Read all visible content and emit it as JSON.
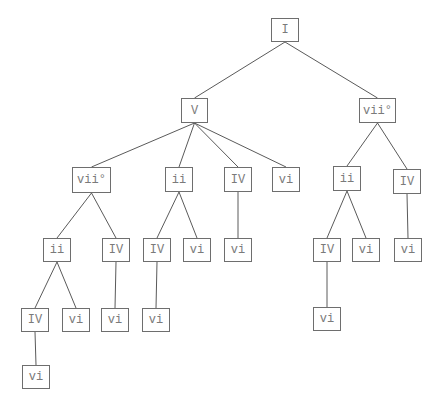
{
  "diagram": {
    "type": "tree",
    "colors": {
      "edge": "#5a5a5a",
      "border": "#6e6e6e",
      "text": "#7a7a7a"
    },
    "nodes": [
      {
        "id": "n0",
        "label": "I",
        "x": 271,
        "y": 18,
        "w": 28,
        "h": 24
      },
      {
        "id": "n1",
        "label": "V",
        "x": 181,
        "y": 98,
        "w": 27,
        "h": 25
      },
      {
        "id": "n2",
        "label": "vii°",
        "x": 359,
        "y": 98,
        "w": 37,
        "h": 25
      },
      {
        "id": "n3",
        "label": "vii°",
        "x": 72,
        "y": 167,
        "w": 39,
        "h": 26
      },
      {
        "id": "n4",
        "label": "ii",
        "x": 165,
        "y": 167,
        "w": 28,
        "h": 25
      },
      {
        "id": "n5",
        "label": "IV",
        "x": 224,
        "y": 167,
        "w": 28,
        "h": 25
      },
      {
        "id": "n6",
        "label": "vi",
        "x": 272,
        "y": 167,
        "w": 28,
        "h": 25
      },
      {
        "id": "n7",
        "label": "ii",
        "x": 333,
        "y": 166,
        "w": 28,
        "h": 25
      },
      {
        "id": "n8",
        "label": "IV",
        "x": 393,
        "y": 169,
        "w": 28,
        "h": 25
      },
      {
        "id": "n9",
        "label": "ii",
        "x": 43,
        "y": 238,
        "w": 28,
        "h": 24
      },
      {
        "id": "n10",
        "label": "IV",
        "x": 102,
        "y": 238,
        "w": 28,
        "h": 24
      },
      {
        "id": "n11",
        "label": "IV",
        "x": 143,
        "y": 238,
        "w": 28,
        "h": 24
      },
      {
        "id": "n12",
        "label": "vi",
        "x": 183,
        "y": 238,
        "w": 28,
        "h": 24
      },
      {
        "id": "n13",
        "label": "vi",
        "x": 224,
        "y": 238,
        "w": 28,
        "h": 24
      },
      {
        "id": "n14",
        "label": "IV",
        "x": 313,
        "y": 238,
        "w": 28,
        "h": 24
      },
      {
        "id": "n15",
        "label": "vi",
        "x": 352,
        "y": 238,
        "w": 28,
        "h": 24
      },
      {
        "id": "n16",
        "label": "vi",
        "x": 394,
        "y": 238,
        "w": 28,
        "h": 24
      },
      {
        "id": "n17",
        "label": "IV",
        "x": 21,
        "y": 308,
        "w": 28,
        "h": 24
      },
      {
        "id": "n18",
        "label": "vi",
        "x": 62,
        "y": 308,
        "w": 28,
        "h": 24
      },
      {
        "id": "n19",
        "label": "vi",
        "x": 101,
        "y": 308,
        "w": 28,
        "h": 24
      },
      {
        "id": "n20",
        "label": "vi",
        "x": 142,
        "y": 308,
        "w": 28,
        "h": 24
      },
      {
        "id": "n21",
        "label": "vi",
        "x": 313,
        "y": 307,
        "w": 28,
        "h": 24
      },
      {
        "id": "n22",
        "label": "vi",
        "x": 22,
        "y": 365,
        "w": 28,
        "h": 24
      }
    ],
    "edges": [
      [
        "n0",
        "n1"
      ],
      [
        "n0",
        "n2"
      ],
      [
        "n1",
        "n3"
      ],
      [
        "n1",
        "n4"
      ],
      [
        "n1",
        "n5"
      ],
      [
        "n1",
        "n6"
      ],
      [
        "n2",
        "n7"
      ],
      [
        "n2",
        "n8"
      ],
      [
        "n3",
        "n9"
      ],
      [
        "n3",
        "n10"
      ],
      [
        "n4",
        "n11"
      ],
      [
        "n4",
        "n12"
      ],
      [
        "n5",
        "n13"
      ],
      [
        "n7",
        "n14"
      ],
      [
        "n7",
        "n15"
      ],
      [
        "n8",
        "n16"
      ],
      [
        "n9",
        "n17"
      ],
      [
        "n9",
        "n18"
      ],
      [
        "n10",
        "n19"
      ],
      [
        "n11",
        "n20"
      ],
      [
        "n14",
        "n21"
      ],
      [
        "n17",
        "n22"
      ]
    ]
  }
}
